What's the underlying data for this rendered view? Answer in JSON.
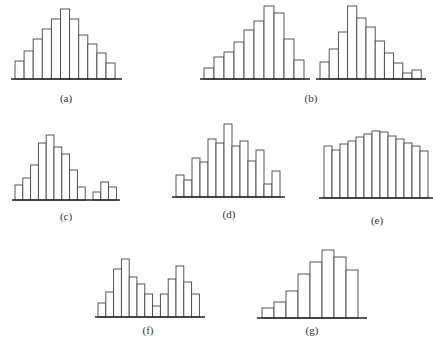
{
  "chart_data": [
    {
      "id": "a",
      "type": "bar",
      "title": "",
      "label": "(a)",
      "description": "symmetric unimodal histogram",
      "values": [
        18,
        28,
        40,
        50,
        60,
        70,
        60,
        44,
        35,
        26,
        16
      ],
      "geometry": {
        "x0": 15,
        "bar_w": 9.1,
        "baseline": 79,
        "axis_x0": 11,
        "axis_x1": 122
      },
      "label_pos": {
        "x": 66,
        "y": 92
      }
    },
    {
      "id": "b-left",
      "type": "bar",
      "title": "",
      "label": "",
      "description": "left-skewed histogram",
      "values": [
        11,
        22,
        27,
        37,
        49,
        58,
        73,
        66,
        40,
        19
      ],
      "geometry": {
        "x0": 204,
        "bar_w": 10,
        "baseline": 79,
        "axis_x0": 200,
        "axis_x1": 310
      },
      "label_pos": null
    },
    {
      "id": "b-right",
      "type": "bar",
      "title": "",
      "label": "(b)",
      "description": "right-skewed histogram",
      "values": [
        17,
        30,
        47,
        73,
        61,
        52,
        38,
        26,
        16,
        6,
        9
      ],
      "geometry": {
        "x0": 320,
        "bar_w": 9.2,
        "baseline": 79,
        "axis_x0": 316,
        "axis_x1": 426
      },
      "label_pos": {
        "x": 311,
        "y": 92
      }
    },
    {
      "id": "c",
      "type": "bar",
      "title": "",
      "label": "(c)",
      "description": "unimodal with outlying small cluster",
      "values": [
        15,
        22,
        35,
        57,
        65,
        53,
        46,
        30,
        13,
        0,
        8,
        18,
        13
      ],
      "geometry": {
        "x0": 15,
        "bar_w": 7.8,
        "baseline": 200,
        "axis_x0": 12,
        "axis_x1": 120
      },
      "label_pos": {
        "x": 66,
        "y": 210
      }
    },
    {
      "id": "d",
      "type": "bar",
      "title": "",
      "label": "(d)",
      "description": "jagged/comb-like histogram",
      "values": [
        22,
        17,
        39,
        35,
        58,
        54,
        73,
        51,
        56,
        36,
        47,
        13,
        26
      ],
      "geometry": {
        "x0": 176,
        "bar_w": 8,
        "baseline": 197,
        "axis_x0": 172,
        "axis_x1": 285
      },
      "label_pos": {
        "x": 229,
        "y": 208
      }
    },
    {
      "id": "e",
      "type": "bar",
      "title": "",
      "label": "(e)",
      "description": "plateau / flat histogram",
      "values": [
        52,
        48,
        54,
        57,
        61,
        64,
        67,
        66,
        62,
        59,
        55,
        52,
        47
      ],
      "geometry": {
        "x0": 324,
        "bar_w": 8,
        "baseline": 198,
        "axis_x0": 319,
        "axis_x1": 433
      },
      "label_pos": {
        "x": 377,
        "y": 214
      }
    },
    {
      "id": "f",
      "type": "bar",
      "title": "",
      "label": "(f)",
      "description": "bimodal histogram",
      "values": [
        14,
        25,
        48,
        58,
        40,
        33,
        23,
        11,
        23,
        38,
        51,
        35,
        23
      ],
      "geometry": {
        "x0": 98,
        "bar_w": 7.8,
        "baseline": 317,
        "axis_x0": 95,
        "axis_x1": 205
      },
      "label_pos": {
        "x": 148,
        "y": 324
      }
    },
    {
      "id": "g",
      "type": "bar",
      "title": "",
      "label": "(g)",
      "description": "cliff-like / truncated histogram",
      "values": [
        10,
        16,
        27,
        44,
        56,
        68,
        61,
        48
      ],
      "geometry": {
        "x0": 262,
        "bar_w": 12,
        "baseline": 318,
        "axis_x0": 257,
        "axis_x1": 367
      },
      "label_pos": {
        "x": 312,
        "y": 324
      }
    }
  ],
  "style": {
    "bar_fill": "#ffffff",
    "bar_stroke": "#444444",
    "axis_color": "#222222"
  }
}
